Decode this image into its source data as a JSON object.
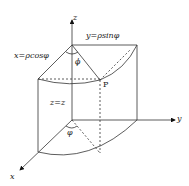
{
  "labels": {
    "z_axis": "z",
    "y_axis": "y",
    "x_axis": "x",
    "y_eq": "y=ρsinφ",
    "x_eq": "x=ρcosφ",
    "z_eq": "z=z",
    "phi_top": "ϕ",
    "phi_bottom": "φ",
    "point": "P"
  }
}
